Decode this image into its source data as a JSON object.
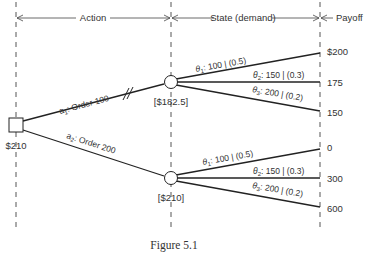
{
  "header": {
    "action_label": "Action",
    "state_label": "State (demand)",
    "payoff_label": "Payoff"
  },
  "decision_node": {
    "value": "$210"
  },
  "actions": [
    {
      "label_prefix": "a",
      "label_sub": "1",
      "label_text": ": Order 100",
      "pruned": true,
      "chance_node_value": "[$182.5]",
      "branches": [
        {
          "theta_sub": "1",
          "label": ": 100 | (0.5)",
          "payoff": "$200"
        },
        {
          "theta_sub": "2",
          "label": ": 150 | (0.3)",
          "payoff": "175"
        },
        {
          "theta_sub": "3",
          "label": ": 200 | (0.2)",
          "payoff": "150"
        }
      ]
    },
    {
      "label_prefix": "a",
      "label_sub": "2",
      "label_text": ": Order 200",
      "pruned": false,
      "chance_node_value": "[$210]",
      "branches": [
        {
          "theta_sub": "1",
          "label": ": 100 | (0.5)",
          "payoff": "0"
        },
        {
          "theta_sub": "2",
          "label": ": 150 | (0.3)",
          "payoff": "300"
        },
        {
          "theta_sub": "3",
          "label": ": 200 | (0.2)",
          "payoff": "600"
        }
      ]
    }
  ],
  "caption": "Figure 5.1",
  "colors": {
    "line": "#222222",
    "text": "#333333",
    "background": "#ffffff"
  }
}
